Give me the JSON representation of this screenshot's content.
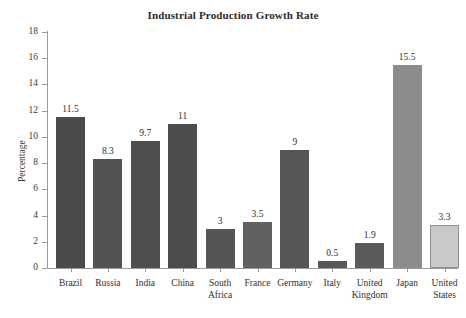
{
  "chart_data": {
    "type": "bar",
    "title": "Industrial Production Growth Rate",
    "xlabel": "",
    "ylabel": "Percentage",
    "ylim": [
      0,
      18
    ],
    "ytick_step": 2,
    "yticks": [
      "0",
      "2",
      "4",
      "6",
      "8",
      "10",
      "12",
      "14",
      "16",
      "18"
    ],
    "grid": false,
    "legend": "none",
    "value_labels_shown": true,
    "categories": [
      "Brazil",
      "Russia",
      "India",
      "China",
      "South Africa",
      "France",
      "Germany",
      "Italy",
      "United Kingdom",
      "Japan",
      "United States"
    ],
    "category_label_lines": [
      [
        "Brazil"
      ],
      [
        "Russia"
      ],
      [
        "India"
      ],
      [
        "China"
      ],
      [
        "South",
        "Africa"
      ],
      [
        "France"
      ],
      [
        "Germany"
      ],
      [
        "Italy"
      ],
      [
        "United",
        "Kingdom"
      ],
      [
        "Japan"
      ],
      [
        "United",
        "States"
      ]
    ],
    "values": [
      11.5,
      8.3,
      9.7,
      11,
      3,
      3.5,
      9,
      0.5,
      1.9,
      15.5,
      3.3
    ],
    "value_labels": [
      "11.5",
      "8.3",
      "9.7",
      "11",
      "3",
      "3.5",
      "9",
      "0.5",
      "1.9",
      "15.5",
      "3.3"
    ],
    "bar_colors": [
      "#4b4b4b",
      "#535353",
      "#4e4e4e",
      "#4c4c4c",
      "#555555",
      "#616161",
      "#565656",
      "#585858",
      "#5b5b5b",
      "#8c8c8c",
      "#c9c9c9"
    ],
    "bar_border_color": "#8f8f8f",
    "axis_color": "#9a9a9a",
    "text_color": "#2f2f2f",
    "background": "#ffffff"
  }
}
